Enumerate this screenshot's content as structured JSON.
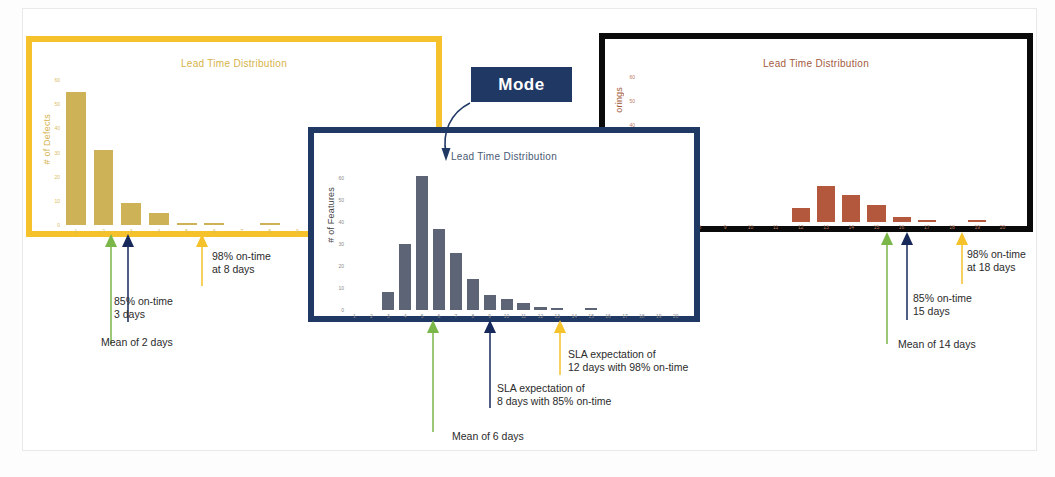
{
  "slide": {
    "background": "#ffffff",
    "frame_color": "#e9e9ec"
  },
  "colors": {
    "yellow": "#f5c22b",
    "yellow_bar": "#cdb257",
    "navy": "#1f3864",
    "navy_bar": "#5d6476",
    "black": "#0a0a0a",
    "rust_bar": "#b4583d",
    "green_arrow": "#7ab648",
    "navy_arrow": "#17295a",
    "yellow_arrow": "#f5c22b"
  },
  "callout": {
    "label": "Mode"
  },
  "panels": [
    {
      "id": "defects",
      "border_color": "#f5c22b",
      "chart_data": {
        "type": "bar",
        "title": "Lead Time Distribution",
        "xlabel": "",
        "ylabel": "# of Defects",
        "categories": [
          "1",
          "2",
          "3",
          "4",
          "5",
          "6",
          "7",
          "8",
          "9",
          "10",
          "11",
          "12",
          "13"
        ],
        "values": [
          55,
          31,
          9,
          5,
          1,
          1,
          0,
          1,
          0,
          0,
          0,
          0,
          0
        ],
        "yticks": [
          0,
          10,
          20,
          30,
          40,
          50,
          60
        ],
        "ylim": [
          0,
          60
        ],
        "grid": false,
        "legend": "none",
        "bar_color": "#cdb257"
      },
      "annotations": [
        {
          "id": "mean",
          "arrow_color": "#7ab648",
          "text": "Mean of 2 days",
          "value": 2
        },
        {
          "id": "sla85",
          "arrow_color": "#17295a",
          "text": "85% on-time\n3 days",
          "value": 3
        },
        {
          "id": "sla98",
          "arrow_color": "#f5c22b",
          "text": "98% on-time\nat 8 days",
          "value": 8
        }
      ]
    },
    {
      "id": "features",
      "border_color": "#1f3864",
      "chart_data": {
        "type": "bar",
        "title": "Lead Time Distribution",
        "xlabel": "",
        "ylabel": "# of Features",
        "categories": [
          "1",
          "2",
          "3",
          "4",
          "5",
          "6",
          "7",
          "8",
          "9",
          "10",
          "11",
          "12",
          "13",
          "14",
          "15",
          "16",
          "17",
          "18",
          "19",
          "20"
        ],
        "values": [
          0,
          0,
          8,
          30,
          61,
          37,
          26,
          14,
          7,
          5,
          3,
          1.5,
          0.8,
          0,
          0.8,
          0,
          0,
          0,
          0,
          0
        ],
        "yticks": [
          0,
          10,
          20,
          30,
          40,
          50,
          60
        ],
        "ylim": [
          0,
          65
        ],
        "grid": false,
        "legend": "none",
        "bar_color": "#5d6476"
      },
      "annotations": [
        {
          "id": "mean",
          "arrow_color": "#7ab648",
          "text": "Mean of 6 days",
          "value": 6
        },
        {
          "id": "sla85",
          "arrow_color": "#17295a",
          "text": "SLA expectation of\n8 days with 85% on-time",
          "value": 8
        },
        {
          "id": "sla98",
          "arrow_color": "#f5c22b",
          "text": "SLA expectation of\n12 days with 98% on-time",
          "value": 12
        }
      ]
    },
    {
      "id": "scorings",
      "border_color": "#0a0a0a",
      "chart_data": {
        "type": "bar",
        "title": "Lead Time Distribution",
        "xlabel": "",
        "ylabel": "orings",
        "categories": [
          "6",
          "7",
          "8",
          "9",
          "10",
          "11",
          "12",
          "13",
          "14",
          "15",
          "16",
          "17",
          "18",
          "19",
          "20"
        ],
        "values": [
          0,
          0,
          0,
          0,
          0,
          0,
          6,
          15,
          11,
          7,
          2,
          1,
          0,
          1,
          0
        ],
        "yticks": [
          40,
          50,
          60
        ],
        "ylim": [
          0,
          60
        ],
        "grid": false,
        "legend": "none",
        "bar_color": "#b4583d"
      },
      "annotations": [
        {
          "id": "mean",
          "arrow_color": "#7ab648",
          "text": "Mean of 14 days",
          "value": 14
        },
        {
          "id": "sla85",
          "arrow_color": "#17295a",
          "text": "85% on-time\n15 days",
          "value": 15
        },
        {
          "id": "sla98",
          "arrow_color": "#f5c22b",
          "text": "98% on-time\nat 18 days",
          "value": 18
        }
      ]
    }
  ]
}
